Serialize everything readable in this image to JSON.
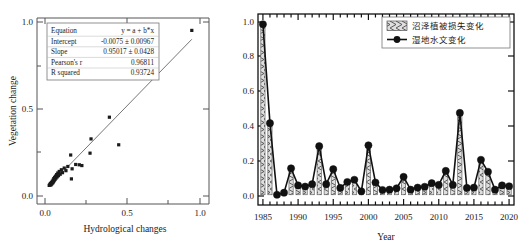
{
  "figure": {
    "background": "#ffffff",
    "panels": [
      "scatter-regression",
      "timeseries-bar-line"
    ]
  },
  "chart_data": [
    {
      "id": "left",
      "type": "scatter",
      "title": "",
      "xlabel": "Hydrological changes",
      "ylabel": "Vegetation change",
      "xlim": [
        -0.08,
        1.12
      ],
      "ylim": [
        -0.12,
        1.08
      ],
      "xticks": [
        0.0,
        0.5,
        1.0
      ],
      "xticklabels": [
        "0.0",
        "0.5",
        "1.0"
      ],
      "yticks": [
        0.0,
        0.5,
        1.0
      ],
      "yticklabels": [
        "0.0",
        "0.5",
        "1.0"
      ],
      "grid": false,
      "legend_position": "none",
      "marker": "square",
      "marker_color": "#1a1a1a",
      "fit_line": {
        "color": "#666666",
        "x": [
          0.0,
          1.0
        ],
        "y": [
          -0.0075,
          0.94267
        ]
      },
      "points": [
        [
          0.005,
          0.0
        ],
        [
          0.01,
          0.005
        ],
        [
          0.013,
          0.012
        ],
        [
          0.016,
          0.002
        ],
        [
          0.02,
          0.018
        ],
        [
          0.022,
          0.008
        ],
        [
          0.026,
          0.026
        ],
        [
          0.029,
          0.015
        ],
        [
          0.032,
          0.034
        ],
        [
          0.034,
          0.022
        ],
        [
          0.037,
          0.044
        ],
        [
          0.04,
          0.03
        ],
        [
          0.043,
          0.052
        ],
        [
          0.046,
          0.038
        ],
        [
          0.05,
          0.06
        ],
        [
          0.053,
          0.047
        ],
        [
          0.057,
          0.07
        ],
        [
          0.061,
          0.055
        ],
        [
          0.065,
          0.08
        ],
        [
          0.07,
          0.063
        ],
        [
          0.075,
          0.09
        ],
        [
          0.082,
          0.072
        ],
        [
          0.09,
          0.101
        ],
        [
          0.098,
          0.082
        ],
        [
          0.11,
          0.112
        ],
        [
          0.122,
          0.095
        ],
        [
          0.135,
          0.122
        ],
        [
          0.155,
          0.196
        ],
        [
          0.16,
          0.042
        ],
        [
          0.165,
          0.107
        ],
        [
          0.19,
          0.135
        ],
        [
          0.215,
          0.133
        ],
        [
          0.233,
          0.128
        ],
        [
          0.29,
          0.208
        ],
        [
          0.297,
          0.3
        ],
        [
          0.425,
          0.44
        ],
        [
          0.49,
          0.262
        ],
        [
          1.0,
          1.0
        ]
      ],
      "stats": {
        "rows": [
          {
            "label": "Equation",
            "value": "y = a + b*x"
          },
          {
            "label": "Intercept",
            "value": "-0.0075 ± 0.00967"
          },
          {
            "label": "Slope",
            "value": "0.95017 ± 0.0428"
          },
          {
            "label": "Pearson's r",
            "value": "0.96811"
          },
          {
            "label": "R squared",
            "value": "0.93724"
          }
        ]
      }
    },
    {
      "id": "right",
      "type": "bar",
      "title": "",
      "xlabel": "Year",
      "ylabel": "",
      "xlim": [
        1984.3,
        2020.7
      ],
      "ylim": [
        -0.06,
        1.06
      ],
      "xticks": [
        1985,
        1990,
        1995,
        2000,
        2005,
        2010,
        2015,
        2020
      ],
      "xticklabels": [
        "1985",
        "1990",
        "1995",
        "2000",
        "2005",
        "2010",
        "2015",
        "2020"
      ],
      "yticks": [
        0.0,
        0.2,
        0.4,
        0.6,
        0.8,
        1.0
      ],
      "yticklabels": [
        "0.0",
        "0.2",
        "0.4",
        "0.6",
        "0.8",
        "1.0"
      ],
      "grid": false,
      "legend_position": "top-right",
      "categories": [
        1985,
        1986,
        1987,
        1988,
        1989,
        1990,
        1991,
        1992,
        1993,
        1994,
        1995,
        1996,
        1997,
        1998,
        1999,
        2000,
        2001,
        2002,
        2003,
        2004,
        2005,
        2006,
        2007,
        2008,
        2009,
        2010,
        2011,
        2012,
        2013,
        2014,
        2015,
        2016,
        2017,
        2018,
        2019,
        2020
      ],
      "series": [
        {
          "name": "沼泽植被损失变化",
          "style": "bar-hatched",
          "fill": "#d9d9d9",
          "edge": "#555555",
          "values": [
            1.0,
            0.42,
            0.0,
            0.012,
            0.155,
            0.055,
            0.048,
            0.062,
            0.285,
            0.062,
            0.15,
            0.04,
            0.075,
            0.088,
            0.02,
            0.29,
            0.072,
            0.028,
            0.03,
            0.038,
            0.105,
            0.03,
            0.042,
            0.047,
            0.068,
            0.058,
            0.14,
            0.058,
            0.48,
            0.04,
            0.042,
            0.205,
            0.135,
            0.03,
            0.055,
            0.05
          ]
        },
        {
          "name": "湿地水文变化",
          "style": "line-marker",
          "color": "#111111",
          "values": [
            1.0,
            0.42,
            0.0,
            0.012,
            0.155,
            0.055,
            0.048,
            0.062,
            0.285,
            0.062,
            0.15,
            0.04,
            0.075,
            0.088,
            0.02,
            0.29,
            0.072,
            0.028,
            0.03,
            0.038,
            0.105,
            0.03,
            0.042,
            0.047,
            0.068,
            0.058,
            0.14,
            0.058,
            0.48,
            0.04,
            0.042,
            0.205,
            0.135,
            0.03,
            0.055,
            0.05
          ]
        }
      ],
      "legend": [
        {
          "label": "沼泽植被损失变化",
          "marker": "hatched-swatch"
        },
        {
          "label": "湿地水文变化",
          "marker": "line-dot"
        }
      ]
    }
  ]
}
